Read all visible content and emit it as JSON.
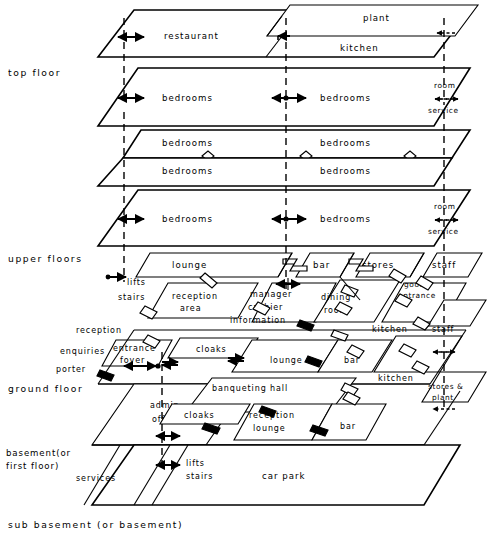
{
  "diagram": {
    "type": "architectural-layer-diagram",
    "ink_color": "#000000",
    "paper_color": "#ffffff"
  },
  "side_labels": [
    {
      "id": "top-floor",
      "text": "top  floor"
    },
    {
      "id": "upper-floors",
      "text": "upper  floors"
    },
    {
      "id": "ground-floor",
      "text": "ground  floor"
    },
    {
      "id": "basement",
      "text": "basement(or"
    },
    {
      "id": "basement2",
      "text": "first floor)"
    },
    {
      "id": "sub-basement",
      "text": "sub  basement  (or  basement)"
    }
  ],
  "levels": [
    {
      "id": "top-floor",
      "name": "top floor",
      "rooms": [
        "restaurant",
        "plant",
        "kitchen"
      ],
      "annotations": [
        "room",
        "service"
      ]
    },
    {
      "id": "upper-floor-1",
      "name": "upper bedroom floor (upper)",
      "rooms": [
        "bedrooms",
        "bedrooms"
      ],
      "annotations": [
        "room",
        "service"
      ]
    },
    {
      "id": "upper-floor-2",
      "name": "typical bedroom floor",
      "rooms": [
        "bedrooms",
        "bedrooms"
      ]
    },
    {
      "id": "upper-floor-3",
      "name": "typical bedroom floor",
      "rooms": [
        "bedrooms",
        "bedrooms"
      ]
    },
    {
      "id": "upper-floor-4",
      "name": "lowest bedroom floor",
      "rooms": [
        "bedrooms",
        "bedrooms"
      ],
      "annotations": [
        "room",
        "service"
      ]
    },
    {
      "id": "first-floor",
      "name": "upper public floor",
      "rooms": [
        "lounge",
        "bar",
        "stores",
        "staff",
        "lifts",
        "stairs",
        "reception area",
        "manager",
        "cashier",
        "information",
        "dining room",
        "goods entrance",
        "kitchen",
        "staff"
      ]
    },
    {
      "id": "ground-floor",
      "name": "ground floor",
      "rooms": [
        "reception",
        "enquiries",
        "porter",
        "entrance foyer",
        "cloaks",
        "lounge",
        "bar",
        "kitchen",
        "stores & plant"
      ]
    },
    {
      "id": "lower-ground",
      "name": "banqueting floor",
      "rooms": [
        "admin offices",
        "banqueting hall",
        "cloaks",
        "reception lounge",
        "bar"
      ]
    },
    {
      "id": "basement",
      "name": "basement (or first floor)",
      "rooms": [
        "services",
        "lifts",
        "stairs",
        "car park"
      ]
    }
  ],
  "room_labels": {
    "restaurant": "restaurant",
    "plant": "plant",
    "kitchen": "kitchen",
    "bedrooms": "bedrooms",
    "room": "room",
    "service": "service",
    "lounge": "lounge",
    "bar": "bar",
    "stores": "stores",
    "staff": "staff",
    "lifts": "lifts",
    "stairs": "stairs",
    "reception_area_1": "reception",
    "reception_area_2": "area",
    "manager": "manager",
    "cashier": "cashier",
    "information": "information",
    "dining_1": "dining",
    "dining_2": "room",
    "goods_1": "goods",
    "goods_2": "entrance",
    "reception": "reception",
    "enquiries": "enquiries",
    "porter": "porter",
    "entrance_1": "entrance",
    "entrance_2": "foyer",
    "cloaks": "cloaks",
    "stores_plant_1": "stores &",
    "stores_plant_2": "plant",
    "admin_1": "admin",
    "admin_2": "offices",
    "banqueting": "banqueting   hall",
    "reception_lounge_1": "reception",
    "reception_lounge_2": "lounge",
    "services": "services",
    "car_park": "car  park"
  },
  "symbols": {
    "vertical_circulation": "dashed-vertical-line",
    "link": "z-shaped-link-symbol",
    "break": "small-diamond-break-symbol",
    "flow_arrow": "double-headed-arrow",
    "service_arrow": "dashed-double-headed-arrow"
  }
}
